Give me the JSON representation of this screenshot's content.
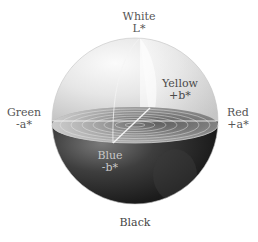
{
  "diagram": {
    "type": "CIELAB color space sphere",
    "axes": {
      "top": {
        "name": "White",
        "symbol": "L*"
      },
      "bottom": {
        "name": "Black"
      },
      "left": {
        "name": "Green",
        "symbol": "-a*"
      },
      "right": {
        "name": "Red",
        "symbol": "+a*"
      },
      "back": {
        "name": "Yellow",
        "symbol": "+b*"
      },
      "front": {
        "name": "Blue",
        "symbol": "-b*"
      }
    },
    "colors": {
      "upper_hemisphere_light": "#f4f4f4",
      "upper_hemisphere_mid": "#d8d8d8",
      "lower_hemisphere_dark": "#1e1e1e",
      "lower_hemisphere_mid": "#5a5a5a",
      "equator_disc": "#9a9a9a",
      "axis_lines": "#f2f2f2"
    }
  }
}
